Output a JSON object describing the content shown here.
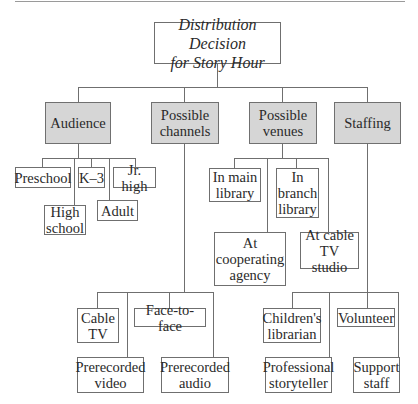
{
  "title": "Distribution Decision\nfor Story Hour",
  "categories": [
    {
      "label": "Audience",
      "items": [
        "Preschool",
        "K–3",
        "Jr. high",
        "High\nschool",
        "Adult"
      ]
    },
    {
      "label": "Possible\nchannels",
      "items": [
        "Cable\nTV",
        "Face-to-face",
        "Prerecorded\nvideo",
        "Prerecorded\naudio"
      ]
    },
    {
      "label": "Possible\nvenues",
      "items": [
        "In main\nlibrary",
        "In\nbranch\nlibrary",
        "At\ncooperating\nagency",
        "At cable\nTV studio"
      ]
    },
    {
      "label": "Staffing",
      "items": [
        "Children's\nlibrarian",
        "Volunteer",
        "Professional\nstoryteller",
        "Support\nstaff"
      ]
    }
  ],
  "colors": {
    "category_fill": "#d6d6d6",
    "line": "#6f6f6f",
    "border": "#6f6f6f"
  }
}
